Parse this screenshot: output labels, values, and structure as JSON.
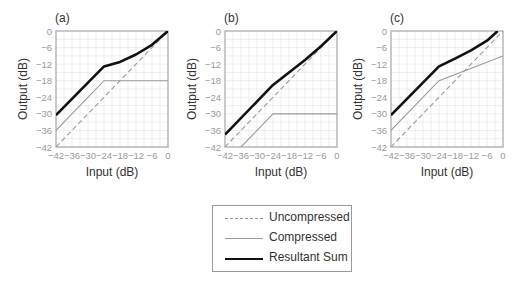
{
  "chart_data": [
    {
      "type": "line",
      "panel_label": "(a)",
      "xlabel": "Input (dB)",
      "ylabel": "Output (dB)",
      "xlim": [
        -42,
        0
      ],
      "ylim": [
        -42,
        0
      ],
      "xticks": [
        -42,
        -36,
        -30,
        -24,
        -18,
        -12,
        -6,
        0
      ],
      "yticks": [
        0,
        -6,
        -12,
        -18,
        -24,
        -30,
        -36,
        -42
      ],
      "grid": true,
      "series": [
        {
          "name": "Uncompressed",
          "x": [
            -42,
            0
          ],
          "y": [
            -42,
            0
          ]
        },
        {
          "name": "Compressed",
          "x": [
            -42,
            -24,
            0
          ],
          "y": [
            -36,
            -18,
            -18
          ]
        },
        {
          "name": "Resultant Sum",
          "x": [
            -42,
            -24,
            -18,
            -12,
            -6,
            0
          ],
          "y": [
            -30.5,
            -12.8,
            -11.2,
            -8.5,
            -5,
            0
          ]
        }
      ]
    },
    {
      "type": "line",
      "panel_label": "(b)",
      "xlabel": "Input (dB)",
      "ylabel": "Output (dB)",
      "xlim": [
        -42,
        0
      ],
      "ylim": [
        -42,
        0
      ],
      "xticks": [
        -42,
        -36,
        -30,
        -24,
        -18,
        -12,
        -6,
        0
      ],
      "yticks": [
        0,
        -6,
        -12,
        -18,
        -24,
        -30,
        -36,
        -42
      ],
      "grid": true,
      "series": [
        {
          "name": "Uncompressed",
          "x": [
            -42,
            0
          ],
          "y": [
            -42,
            0
          ]
        },
        {
          "name": "Compressed",
          "x": [
            -36,
            -24,
            0
          ],
          "y": [
            -42,
            -30,
            -30
          ]
        },
        {
          "name": "Resultant Sum",
          "x": [
            -42,
            -24,
            -18,
            -12,
            -6,
            0
          ],
          "y": [
            -37.5,
            -19.5,
            -15,
            -10.5,
            -5.5,
            0
          ]
        }
      ]
    },
    {
      "type": "line",
      "panel_label": "(c)",
      "xlabel": "Input (dB)",
      "ylabel": "Output (dB)",
      "xlim": [
        -42,
        0
      ],
      "ylim": [
        -42,
        0
      ],
      "xticks": [
        -42,
        -36,
        -30,
        -24,
        -18,
        -12,
        -6,
        0
      ],
      "yticks": [
        0,
        -6,
        -12,
        -18,
        -24,
        -30,
        -36,
        -42
      ],
      "grid": true,
      "series": [
        {
          "name": "Uncompressed",
          "x": [
            -42,
            0
          ],
          "y": [
            -42,
            0
          ]
        },
        {
          "name": "Compressed",
          "x": [
            -42,
            -24,
            0
          ],
          "y": [
            -36,
            -18,
            -9
          ]
        },
        {
          "name": "Resultant Sum",
          "x": [
            -42,
            -24,
            -18,
            -12,
            -6,
            -2
          ],
          "y": [
            -30.5,
            -12.8,
            -10,
            -7,
            -3.5,
            0
          ]
        }
      ]
    }
  ],
  "legend": {
    "entries": [
      {
        "label": "Uncompressed",
        "style": "dashed"
      },
      {
        "label": "Compressed",
        "style": "thin"
      },
      {
        "label": "Resultant Sum",
        "style": "thick"
      }
    ]
  },
  "colors": {
    "uncompressed": "#9a9a9a",
    "compressed": "#9a9a9a",
    "resultant": "#111111",
    "grid": "#e2e2e2",
    "frame": "#bdbdbd"
  }
}
